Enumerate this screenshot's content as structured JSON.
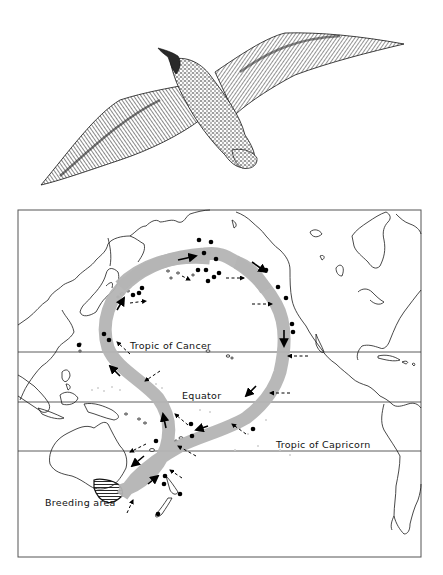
{
  "figure": {
    "illustration": {
      "subject": "seabird in flight (shearwater), viewed from below, wings outstretched",
      "style": "pen-and-ink stipple and hatching"
    },
    "map": {
      "region": "Pacific Ocean",
      "labels": {
        "tropic_of_cancer": "Tropic of Cancer",
        "equator": "Equator",
        "tropic_of_capricorn": "Tropic of Capricorn",
        "breeding_area": "Breeding area"
      },
      "legend_semantics": {
        "route_band": "grey band — main migration route (figure-of-eight loop around the Pacific)",
        "solid_arrow": "direction of migration along route",
        "dashed_arrow": "prevailing wind direction",
        "dot": "sighting / recovery location",
        "hatched_area": "breeding area (SE Australia / Tasmania)"
      },
      "colors": {
        "route_band": "#b4b4b4",
        "ink": "#000000",
        "background": "#ffffff"
      }
    }
  }
}
